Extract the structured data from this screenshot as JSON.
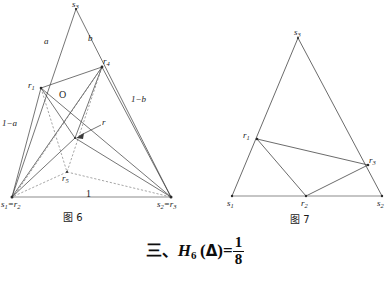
{
  "figure6": {
    "caption": "图 6",
    "vertices": {
      "s3": {
        "x": 76,
        "y": 9,
        "label": "s",
        "sub": "3"
      },
      "s1r2": {
        "x": 12,
        "y": 197,
        "label": "s",
        "sub": "1",
        "label2": "=r",
        "sub2": "2"
      },
      "s2r3": {
        "x": 171,
        "y": 197,
        "label": "s",
        "sub": "2",
        "label2": "=r",
        "sub2": "3"
      },
      "r1": {
        "x": 41,
        "y": 88,
        "label": "r",
        "sub": "1"
      },
      "r4": {
        "x": 102,
        "y": 67,
        "label": "r",
        "sub": "4"
      },
      "r5": {
        "x": 67,
        "y": 172,
        "label": "r",
        "sub": "5"
      },
      "r": {
        "x": 75,
        "y": 138,
        "label": "r"
      }
    },
    "edge_labels": [
      {
        "name": "a",
        "text": "a",
        "x": 47,
        "y": 43
      },
      {
        "name": "b",
        "text": "b",
        "x": 90,
        "y": 41
      },
      {
        "name": "one-minus-a",
        "text": "1−a",
        "x": 4,
        "y": 124
      },
      {
        "name": "one-minus-b",
        "text": "1−b",
        "x": 134,
        "y": 98
      },
      {
        "name": "base-one",
        "text": "1",
        "x": 89,
        "y": 199
      },
      {
        "name": "origin-O",
        "text": "O",
        "x": 62,
        "y": 96
      }
    ]
  },
  "figure7": {
    "caption": "图 7",
    "vertices": {
      "s3": {
        "x": 298,
        "y": 38,
        "label": "s",
        "sub": "3"
      },
      "s1": {
        "x": 232,
        "y": 196,
        "label": "s",
        "sub": "1"
      },
      "s2": {
        "x": 382,
        "y": 196,
        "label": "s",
        "sub": "2"
      },
      "r1": {
        "x": 257,
        "y": 139,
        "label": "r",
        "sub": "1"
      },
      "r2": {
        "x": 306,
        "y": 196,
        "label": "r",
        "sub": "2"
      },
      "r3": {
        "x": 368,
        "y": 165,
        "label": "r",
        "sub": "3"
      }
    }
  },
  "formula": {
    "marker": "三、",
    "function": "H",
    "subscript": "6",
    "argument": "(Δ)",
    "equals": "=",
    "numerator": "1",
    "denominator": "8"
  },
  "colors": {
    "stroke": "#3a3a3a",
    "base_line": "#8c8c8c",
    "text": "#1a1a1a"
  }
}
